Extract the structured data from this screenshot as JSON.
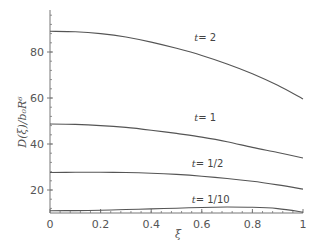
{
  "chart_data": {
    "type": "line",
    "title": "",
    "xlabel": "ξ",
    "ylabel": "D(ξ)/b₀R⁶",
    "xlim": [
      0,
      1
    ],
    "ylim": [
      10,
      98
    ],
    "x_ticks": [
      0,
      0.2,
      0.4,
      0.6,
      0.8,
      1
    ],
    "x_tick_labels": [
      "0",
      "0.2",
      "0.4",
      "0.6",
      "0.8",
      "1"
    ],
    "y_ticks": [
      20,
      40,
      60,
      80
    ],
    "y_tick_labels": [
      "20",
      "40",
      "60",
      "80"
    ],
    "grid": false,
    "legend": "inline curve labels",
    "x": [
      0,
      0.1,
      0.2,
      0.3,
      0.4,
      0.5,
      0.6,
      0.7,
      0.8,
      0.9,
      1.0
    ],
    "series": [
      {
        "name": "t=2",
        "label_text": "t= 2",
        "label_pos": [
          0.57,
          85
        ],
        "values": [
          89.0,
          88.8,
          88.0,
          86.5,
          84.3,
          81.6,
          78.5,
          74.8,
          70.5,
          65.5,
          59.6
        ]
      },
      {
        "name": "t=1",
        "label_text": "t= 1",
        "label_pos": [
          0.57,
          50
        ],
        "values": [
          48.7,
          48.5,
          48.0,
          47.2,
          46.0,
          44.6,
          43.0,
          41.0,
          38.5,
          36.3,
          33.9
        ]
      },
      {
        "name": "t=1/2",
        "label_text": "t= 1/2",
        "label_pos": [
          0.56,
          29.8
        ],
        "values": [
          27.6,
          27.7,
          27.7,
          27.6,
          27.3,
          26.8,
          26.0,
          25.0,
          23.8,
          22.2,
          20.4
        ]
      },
      {
        "name": "t=1/10",
        "label_text": "t= 1/10",
        "label_pos": [
          0.56,
          14.2
        ],
        "values": [
          11.0,
          11.05,
          11.2,
          11.5,
          11.8,
          12.1,
          12.4,
          12.6,
          12.5,
          11.9,
          10.4
        ]
      }
    ]
  },
  "colors": {
    "axis": "#777777",
    "curve": "#555555",
    "text": "#555555"
  }
}
